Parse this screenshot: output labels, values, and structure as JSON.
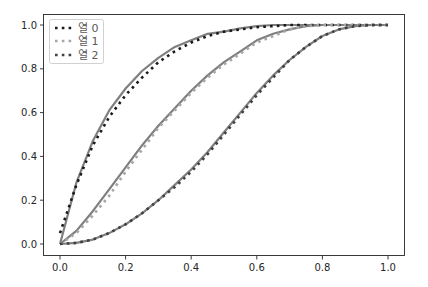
{
  "chart_data": {
    "type": "line",
    "title": "",
    "xlabel": "",
    "ylabel": "",
    "xlim": [
      -0.05,
      1.05
    ],
    "ylim": [
      -0.05,
      1.05
    ],
    "grid": false,
    "legend_position": "upper left",
    "x_ticks": [
      "0.0",
      "0.2",
      "0.4",
      "0.6",
      "0.8",
      "1.0"
    ],
    "y_ticks": [
      "0.0",
      "0.2",
      "0.4",
      "0.6",
      "0.8",
      "1.0"
    ],
    "x": [
      0.0,
      0.05,
      0.1,
      0.15,
      0.2,
      0.25,
      0.3,
      0.35,
      0.4,
      0.45,
      0.5,
      0.55,
      0.6,
      0.65,
      0.7,
      0.75,
      0.8,
      0.85,
      0.9,
      0.95,
      1.0
    ],
    "series": [
      {
        "name": "열 0",
        "style": "dotted",
        "color": "#1a1a1a",
        "smooth_color": "#7f7f7f",
        "values": [
          0.05,
          0.27,
          0.45,
          0.58,
          0.68,
          0.76,
          0.83,
          0.88,
          0.92,
          0.95,
          0.97,
          0.98,
          0.99,
          0.995,
          1.0,
          1.0,
          1.0,
          1.0,
          1.0,
          1.0,
          1.0
        ],
        "smooth_values": [
          0.0,
          0.28,
          0.47,
          0.61,
          0.71,
          0.79,
          0.85,
          0.9,
          0.93,
          0.96,
          0.97,
          0.985,
          0.995,
          1.0,
          1.0,
          1.0,
          1.0,
          1.0,
          1.0,
          1.0,
          1.0
        ]
      },
      {
        "name": "열 1",
        "style": "dotted",
        "color": "#a6a6a6",
        "smooth_color": "#7f7f7f",
        "values": [
          0.0,
          0.05,
          0.13,
          0.22,
          0.33,
          0.43,
          0.53,
          0.61,
          0.69,
          0.76,
          0.82,
          0.87,
          0.92,
          0.95,
          0.98,
          0.995,
          1.0,
          1.0,
          1.0,
          1.0,
          1.0
        ],
        "smooth_values": [
          0.0,
          0.06,
          0.15,
          0.25,
          0.35,
          0.45,
          0.54,
          0.62,
          0.7,
          0.77,
          0.83,
          0.88,
          0.93,
          0.96,
          0.98,
          0.995,
          1.0,
          1.0,
          1.0,
          1.0,
          1.0
        ]
      },
      {
        "name": "열 2",
        "style": "dotted",
        "color": "#404040",
        "smooth_color": "#7f7f7f",
        "values": [
          0.0,
          0.005,
          0.02,
          0.05,
          0.09,
          0.14,
          0.2,
          0.26,
          0.33,
          0.41,
          0.5,
          0.59,
          0.68,
          0.76,
          0.84,
          0.9,
          0.95,
          0.98,
          0.995,
          1.0,
          1.0
        ],
        "smooth_values": [
          0.0,
          0.005,
          0.02,
          0.05,
          0.09,
          0.14,
          0.2,
          0.27,
          0.34,
          0.42,
          0.51,
          0.6,
          0.69,
          0.77,
          0.84,
          0.9,
          0.95,
          0.98,
          0.995,
          1.0,
          1.0
        ]
      }
    ]
  },
  "legend": {
    "items": [
      {
        "label": "열 0",
        "color": "#1a1a1a"
      },
      {
        "label": "열 1",
        "color": "#a6a6a6"
      },
      {
        "label": "열 2",
        "color": "#404040"
      }
    ]
  },
  "axes": {
    "frame_color": "#262626",
    "x_tick_labels": [
      "0.0",
      "0.2",
      "0.4",
      "0.6",
      "0.8",
      "1.0"
    ],
    "y_tick_labels": [
      "0.0",
      "0.2",
      "0.4",
      "0.6",
      "0.8",
      "1.0"
    ]
  }
}
